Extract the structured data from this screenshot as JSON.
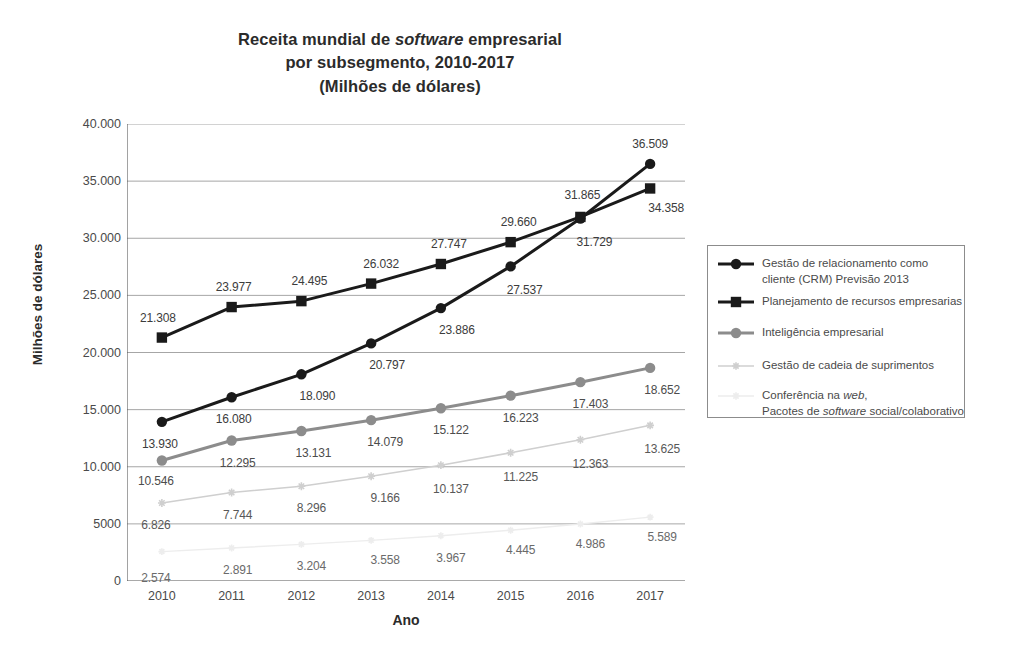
{
  "chart_data": {
    "type": "line",
    "title": "Receita mundial de software empresarial por subsegmento, 2010-2017 (Milhões de dólares)",
    "title_lines": [
      "Receita mundial de software empresarial",
      "por subsegmento, 2010-2017",
      "(Milhões de dólares)"
    ],
    "title_line1_pre": "Receita mundial de ",
    "title_line1_ital": "software",
    "title_line1_post": " empresarial",
    "xlabel": "Ano",
    "ylabel": "Milhões de dólares",
    "categories": [
      "2010",
      "2011",
      "2012",
      "2013",
      "2014",
      "2015",
      "2016",
      "2017"
    ],
    "x": [
      2010,
      2011,
      2012,
      2013,
      2014,
      2015,
      2016,
      2017
    ],
    "ylim": [
      0,
      40000
    ],
    "yticks": [
      0,
      5000,
      10000,
      15000,
      20000,
      25000,
      30000,
      35000,
      40000
    ],
    "ytick_labels": [
      "0",
      "5000",
      "10.000",
      "15.000",
      "20.000",
      "25.000",
      "30.000",
      "35.000",
      "40.000"
    ],
    "grid": true,
    "grid_axis": "y",
    "legend_position": "right",
    "series": [
      {
        "name": "Gestão de relacionamento como cliente (CRM) Previsão 2013",
        "key": "crm",
        "color": "#1a1a1a",
        "marker": "circle",
        "values": [
          13930,
          16080,
          18090,
          20797,
          23886,
          27537,
          31729,
          36509
        ],
        "labels": [
          "13.930",
          "16.080",
          "18.090",
          "20.797",
          "23.886",
          "27.537",
          "31.729",
          "36.509"
        ]
      },
      {
        "name": "Planejamento de recursos empresarias",
        "key": "erp",
        "color": "#1a1a1a",
        "marker": "square",
        "values": [
          21308,
          23977,
          24495,
          26032,
          27747,
          29660,
          31865,
          34358
        ],
        "labels": [
          "21.308",
          "23.977",
          "24.495",
          "26.032",
          "27.747",
          "29.660",
          "31.865",
          "34.358"
        ]
      },
      {
        "name": "Inteligência empresarial",
        "key": "bi",
        "color": "#8c8c8c",
        "marker": "circle",
        "values": [
          10546,
          12295,
          13131,
          14079,
          15122,
          16223,
          17403,
          18652
        ],
        "labels": [
          "10.546",
          "12.295",
          "13.131",
          "14.079",
          "15.122",
          "16.223",
          "17.403",
          "18.652"
        ]
      },
      {
        "name": "Gestão de cadeia de suprimentos",
        "key": "scm",
        "color": "#cfcfcf",
        "marker": "star",
        "values": [
          6826,
          7744,
          8296,
          9166,
          10137,
          11225,
          12363,
          13625
        ],
        "labels": [
          "6.826",
          "7.744",
          "8.296",
          "9.166",
          "10.137",
          "11.225",
          "12.363",
          "13.625"
        ]
      },
      {
        "name": "Conferência na web, Pacotes de software social/colaborativo",
        "key": "web",
        "color": "#ededed",
        "marker": "star",
        "values": [
          2574,
          2891,
          3204,
          3558,
          3967,
          4445,
          4986,
          5589
        ],
        "labels": [
          "2.574",
          "2.891",
          "3.204",
          "3.558",
          "3.967",
          "4.445",
          "4.986",
          "5.589"
        ]
      }
    ],
    "legend_entries": [
      {
        "key": "crm",
        "marker": "circle",
        "color": "#1a1a1a",
        "lines": [
          "Gestão de relacionamento como",
          "cliente (CRM) Previsão 2013"
        ]
      },
      {
        "key": "erp",
        "marker": "square",
        "color": "#1a1a1a",
        "lines": [
          "Planejamento de recursos empresarias"
        ]
      },
      {
        "key": "bi",
        "marker": "circle",
        "color": "#8c8c8c",
        "lines": [
          "Inteligência empresarial"
        ]
      },
      {
        "key": "scm",
        "marker": "star",
        "color": "#cfcfcf",
        "lines": [
          "Gestão de cadeia de suprimentos"
        ]
      },
      {
        "key": "web",
        "marker": "star",
        "color": "#ededed",
        "lines_rich": [
          {
            "pre": "Conferência na ",
            "ital": "web",
            "post": ","
          },
          {
            "pre": "Pacotes de ",
            "ital": "software",
            "post": " social/colaborativo"
          }
        ]
      }
    ]
  }
}
